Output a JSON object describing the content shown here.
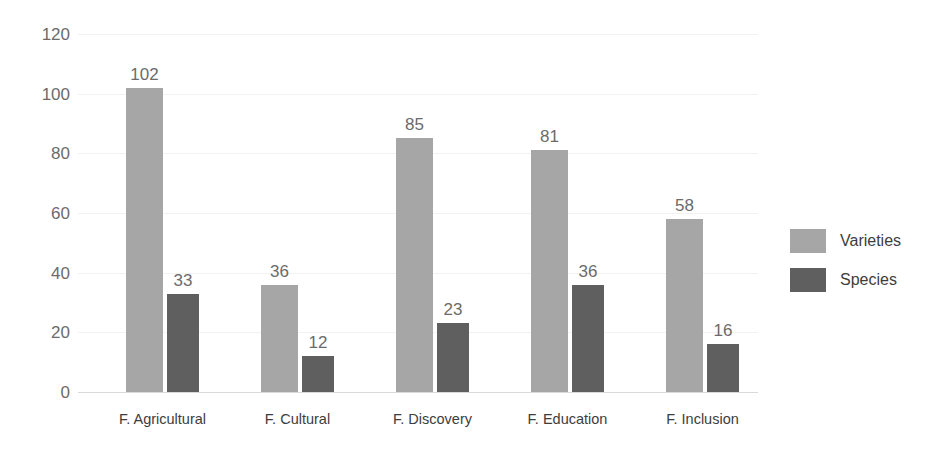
{
  "chart_data": {
    "type": "bar",
    "title": "",
    "subtitle": "",
    "xlabel": "",
    "ylabel": "",
    "categories": [
      "F. Agricultural",
      "F. Cultural",
      "F. Discovery",
      "F. Education",
      "F. Inclusion"
    ],
    "series": [
      {
        "name": "Varieties",
        "color": "#a6a6a6",
        "values": [
          102,
          36,
          85,
          81,
          58
        ]
      },
      {
        "name": "Species",
        "color": "#5f5f5f",
        "values": [
          33,
          12,
          23,
          36,
          16
        ]
      }
    ],
    "ylim": [
      0,
      120
    ],
    "y_ticks": [
      0,
      20,
      40,
      60,
      80,
      100,
      120
    ],
    "y_tick_labels": [
      "0",
      "20",
      "40",
      "60",
      "80",
      "100",
      "120"
    ],
    "data_labels": {
      "Varieties": [
        "102",
        "36",
        "85",
        "81",
        "58"
      ],
      "Species": [
        "33",
        "12",
        "23",
        "36",
        "16"
      ]
    },
    "grid": "horizontal",
    "legend_position": "right",
    "background_color": "#ffffff",
    "label_text_color": "#6b6b6b",
    "axis_text_color": "#3d3d3d"
  }
}
